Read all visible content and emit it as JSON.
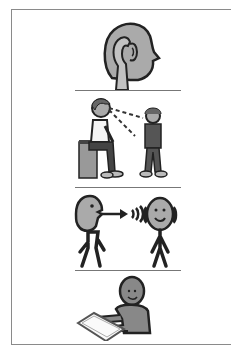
{
  "card": {
    "type": "pictogram-strip",
    "panels": [
      {
        "name": "listen",
        "icon": "ear-listen-icon"
      },
      {
        "name": "look-at-person",
        "icon": "look-at-person-icon"
      },
      {
        "name": "speak-to-person",
        "icon": "speak-listen-icon"
      },
      {
        "name": "do-work",
        "icon": "desk-work-icon"
      }
    ]
  },
  "colors": {
    "frame": "#8a8a8a",
    "divider": "#777777",
    "skin": "#a9a9a9",
    "outline": "#222222",
    "dark_clothes": "#5a5a5a",
    "background": "#ffffff"
  }
}
